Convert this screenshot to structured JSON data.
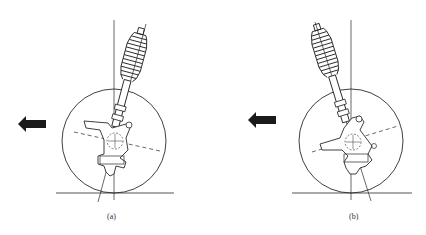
{
  "figure": {
    "panels": [
      {
        "id": "a",
        "label": "(a)",
        "description": "Strut tilted rightward at top (negative caster direction), travel arrow pointing left"
      },
      {
        "id": "b",
        "label": "(b)",
        "description": "Strut tilted leftward at top, travel arrow pointing left"
      }
    ],
    "arrow_direction": "left",
    "colors": {
      "line": "#2a2a2a",
      "arrow": "#1a1a1a",
      "background": "#ffffff"
    }
  }
}
